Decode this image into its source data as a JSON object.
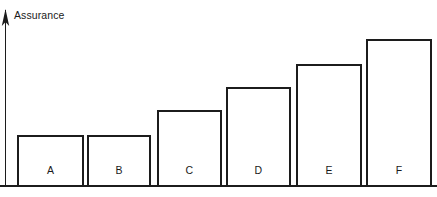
{
  "chart_data": {
    "type": "bar",
    "title": "",
    "subtitle": "",
    "xlabel": "",
    "ylabel": "Assurance",
    "categories": [
      "A",
      "B",
      "C",
      "D",
      "E",
      "F"
    ],
    "values": [
      50,
      50,
      75,
      98,
      121,
      146
    ],
    "ylim": [
      0,
      176
    ],
    "grid": false,
    "legend": null,
    "legend_position": "none",
    "annotations": [],
    "axis_style": {
      "y_axis_arrow": true,
      "x_axis_tick_labels": false,
      "y_axis_tick_labels": false,
      "bar_fill": "#ffffff",
      "bar_stroke": "#1c1c1c",
      "axis_color": "#1c1c1c",
      "background": "#ffffff"
    }
  },
  "axis": {
    "y_label": "Assurance",
    "arrow_icon": "up-arrow-icon",
    "baseline_icon": "horizontal-rule-icon"
  },
  "bars": [
    {
      "label": "A",
      "value": 50,
      "x": 18,
      "width": 65,
      "top": 136
    },
    {
      "label": "B",
      "value": 50,
      "x": 88,
      "width": 62,
      "top": 136
    },
    {
      "label": "C",
      "value": 75,
      "x": 158,
      "width": 63,
      "top": 111
    },
    {
      "label": "D",
      "value": 98,
      "x": 227,
      "width": 63,
      "top": 88
    },
    {
      "label": "E",
      "value": 121,
      "x": 297,
      "width": 64,
      "top": 65
    },
    {
      "label": "F",
      "value": 146,
      "x": 367,
      "width": 64,
      "top": 40
    }
  ],
  "geometry": {
    "canvas_width": 437,
    "canvas_height": 197,
    "baseline_y": 186,
    "axis_x": 5.5,
    "axis_top_y": 10,
    "label_baseline_y": 174
  }
}
